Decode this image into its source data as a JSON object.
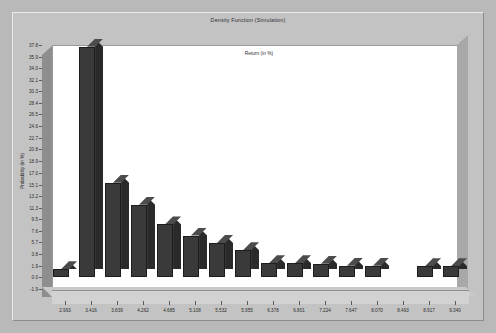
{
  "chart_data": {
    "type": "bar",
    "title": "Density Function (Simulation)",
    "xlabel": "Return (in %)",
    "ylabel": "Probability (in %)",
    "grid": false,
    "legend": "none",
    "projection": "3d-columns",
    "ylim": [
      -1.9,
      37.8
    ],
    "yticks": [
      37.8,
      35.9,
      34.0,
      32.1,
      30.3,
      28.4,
      26.5,
      24.6,
      22.7,
      20.8,
      18.9,
      17.0,
      15.1,
      13.2,
      11.3,
      9.5,
      7.6,
      5.7,
      3.8,
      1.9,
      0.0,
      -1.9
    ],
    "categories": [
      "2.993",
      "3.416",
      "3.839",
      "4.262",
      "4.685",
      "5.108",
      "5.532",
      "5.955",
      "6.378",
      "6.801",
      "7.224",
      "7.647",
      "8.070",
      "8.493",
      "8.917",
      "9.340"
    ],
    "xticks": [
      "2.993",
      "3.416",
      "3.839",
      "4.262",
      "4.685",
      "5.108",
      "5.532",
      "5.955",
      "6.378",
      "6.801",
      "7.224",
      "7.647",
      "8.070",
      "8.493",
      "8.917",
      "9.340"
    ],
    "values": [
      1.3,
      37.5,
      15.4,
      11.8,
      8.6,
      6.8,
      5.6,
      4.4,
      2.3,
      2.3,
      2.2,
      1.9,
      1.9,
      0.0,
      1.8,
      1.8
    ],
    "bar_color": "#3a3a3a",
    "bar_top_color": "#4c4c4c",
    "bar_side_color": "#2a2a2a",
    "canvas_color": "#ffffff",
    "panel_color": "#c3c3c3"
  }
}
